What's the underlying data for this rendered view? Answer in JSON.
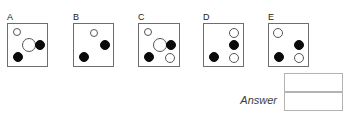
{
  "puzzle": {
    "type": "visual-analogy-multiple-choice",
    "panels": [
      {
        "label": "A",
        "box": {
          "x": 7,
          "y": 23,
          "w": 41,
          "h": 44
        },
        "dots": [
          {
            "name": "small-open-circle-top-left",
            "fill": "open",
            "cx": 9,
            "cy": 8,
            "r": 4
          },
          {
            "name": "large-open-circle-center",
            "fill": "open",
            "cx": 21,
            "cy": 21,
            "r": 7
          },
          {
            "name": "filled-circle-right",
            "fill": "filled",
            "cx": 32,
            "cy": 21,
            "r": 5
          },
          {
            "name": "filled-circle-bottom-left",
            "fill": "filled",
            "cx": 10,
            "cy": 33,
            "r": 5
          }
        ]
      },
      {
        "label": "B",
        "box": {
          "x": 73,
          "y": 23,
          "w": 41,
          "h": 44
        },
        "dots": [
          {
            "name": "small-open-circle-top-center",
            "fill": "open",
            "cx": 20,
            "cy": 9,
            "r": 4
          },
          {
            "name": "filled-circle-right",
            "fill": "filled",
            "cx": 31,
            "cy": 21,
            "r": 5
          },
          {
            "name": "filled-circle-bottom-left",
            "fill": "filled",
            "cx": 10,
            "cy": 33,
            "r": 5
          }
        ]
      },
      {
        "label": "C",
        "box": {
          "x": 138,
          "y": 23,
          "w": 42,
          "h": 44
        },
        "dots": [
          {
            "name": "small-open-circle-top-left",
            "fill": "open",
            "cx": 9,
            "cy": 8,
            "r": 4
          },
          {
            "name": "large-open-circle-center",
            "fill": "open",
            "cx": 21,
            "cy": 21,
            "r": 7
          },
          {
            "name": "filled-circle-right",
            "fill": "filled",
            "cx": 32,
            "cy": 21,
            "r": 5
          },
          {
            "name": "filled-circle-bottom-left",
            "fill": "filled",
            "cx": 10,
            "cy": 33,
            "r": 5
          },
          {
            "name": "small-open-circle-bottom-right",
            "fill": "open",
            "cx": 31,
            "cy": 34,
            "r": 5
          }
        ]
      },
      {
        "label": "D",
        "box": {
          "x": 203,
          "y": 23,
          "w": 41,
          "h": 44
        },
        "dots": [
          {
            "name": "small-open-circle-top-right",
            "fill": "open",
            "cx": 30,
            "cy": 9,
            "r": 5
          },
          {
            "name": "filled-circle-right",
            "fill": "filled",
            "cx": 30,
            "cy": 21,
            "r": 5
          },
          {
            "name": "filled-circle-bottom-left",
            "fill": "filled",
            "cx": 10,
            "cy": 33,
            "r": 5
          },
          {
            "name": "small-open-circle-bottom-right",
            "fill": "open",
            "cx": 30,
            "cy": 34,
            "r": 5
          }
        ]
      },
      {
        "label": "E",
        "box": {
          "x": 268,
          "y": 23,
          "w": 41,
          "h": 44
        },
        "dots": [
          {
            "name": "small-open-circle-top-left",
            "fill": "open",
            "cx": 9,
            "cy": 9,
            "r": 5
          },
          {
            "name": "filled-circle-right",
            "fill": "filled",
            "cx": 30,
            "cy": 21,
            "r": 5
          },
          {
            "name": "filled-circle-bottom-left",
            "fill": "filled",
            "cx": 10,
            "cy": 33,
            "r": 5
          },
          {
            "name": "small-open-circle-bottom-right",
            "fill": "open",
            "cx": 30,
            "cy": 34,
            "r": 5
          }
        ]
      }
    ]
  },
  "answer": {
    "label": "Answer",
    "fields": [
      {
        "name": "answer-field-top",
        "value": "",
        "placeholder": ""
      },
      {
        "name": "answer-field-bottom",
        "value": "",
        "placeholder": ""
      }
    ]
  },
  "colors": {
    "box_border": "#6e6e6e",
    "dot_open_border": "#555555",
    "dot_filled": "#0a0a0a",
    "answer_border": "#b4b4b4",
    "label_text": "#1a1a1a",
    "answer_text": "#3c3c3c",
    "background": "#ffffff"
  }
}
